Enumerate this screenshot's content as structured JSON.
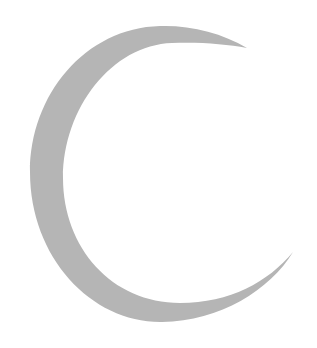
{
  "image": {
    "subject": "crescent-moon",
    "background_color": "#ffffff",
    "shape_color": "#b5b5b5"
  }
}
